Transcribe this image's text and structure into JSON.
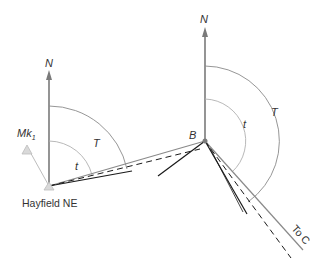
{
  "diagram": {
    "stations": {
      "hayfield": {
        "label": "Hayfield NE",
        "x": 49,
        "y": 186
      },
      "b": {
        "label": "B",
        "x": 205,
        "y": 141
      },
      "mk1": {
        "label": "Mk",
        "subscript": "1",
        "x": 27,
        "y": 148
      }
    },
    "north_labels": {
      "left": "N",
      "right": "N"
    },
    "angle_labels": {
      "left_T": "T",
      "left_t": "t",
      "right_T": "T",
      "right_t": "t"
    },
    "direction_label": "To C",
    "colors": {
      "grey_line": "#8a8a8a",
      "light_line": "#bdbdbd",
      "black_line": "#1a1a1a",
      "marker_fill": "#d9d9d9"
    }
  }
}
